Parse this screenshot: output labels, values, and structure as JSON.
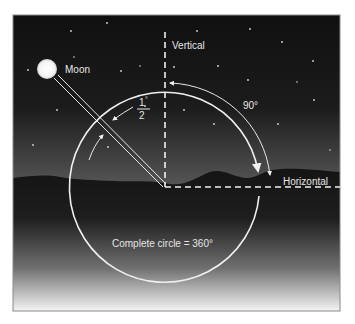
{
  "diagram": {
    "labels": {
      "moon": "Moon",
      "vertical": "Vertical",
      "horizontal": "Horizontal",
      "right_angle": "90°",
      "fraction_numerator": "1",
      "fraction_degree": "°",
      "fraction_denominator": "2",
      "complete_circle": "Complete circle = 360°"
    },
    "colors": {
      "sky_top": "#0f0f0f",
      "sky_horizon": "#4a4a4a",
      "ground_top": "#151515",
      "ground_bottom": "#f2f2f2",
      "line": "#f0f0f0",
      "frame": "#8a8a8a"
    },
    "geometry": {
      "frame": {
        "x": 13,
        "y": 15,
        "width": 327,
        "height": 296
      },
      "circle_center": [
        165,
        187
      ],
      "circle_radius": 95,
      "moon_center": [
        47,
        69
      ],
      "moon_radius": 10
    },
    "stars": [
      [
        107,
        23
      ],
      [
        71,
        31
      ],
      [
        28,
        70
      ],
      [
        121,
        71
      ],
      [
        74,
        57
      ],
      [
        57,
        110
      ],
      [
        33,
        145
      ],
      [
        108,
        147
      ],
      [
        145,
        106
      ],
      [
        84,
        206
      ],
      [
        197,
        31
      ],
      [
        250,
        29
      ],
      [
        282,
        42
      ],
      [
        313,
        61
      ],
      [
        248,
        80
      ],
      [
        218,
        66
      ],
      [
        174,
        67
      ],
      [
        214,
        124
      ],
      [
        314,
        100
      ],
      [
        278,
        124
      ],
      [
        184,
        110
      ],
      [
        297,
        82
      ],
      [
        330,
        150
      ],
      [
        140,
        66
      ]
    ]
  }
}
